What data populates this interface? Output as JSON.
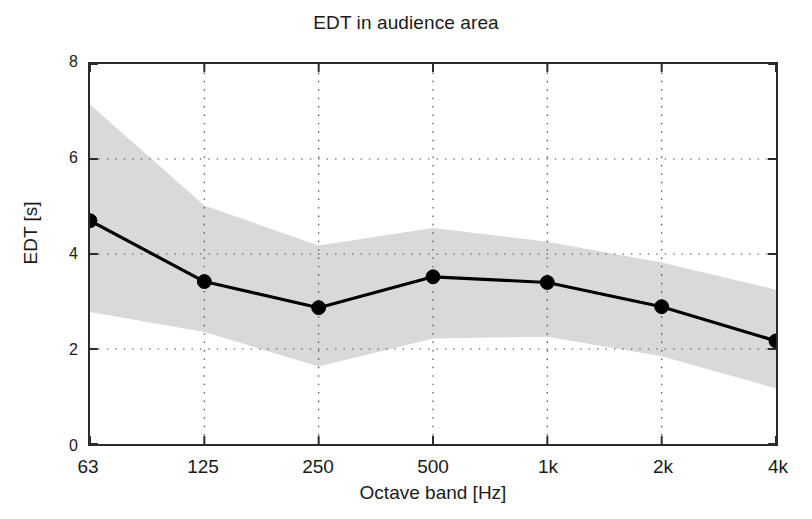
{
  "chart_data": {
    "type": "line",
    "title": "EDT in audience area",
    "xlabel": "Octave band [Hz]",
    "ylabel": "EDT [s]",
    "categories": [
      "63",
      "125",
      "250",
      "500",
      "1k",
      "2k",
      "4k"
    ],
    "values": [
      4.7,
      3.42,
      2.87,
      3.52,
      3.4,
      2.89,
      2.17
    ],
    "series": [
      {
        "name": "EDT mean",
        "values": [
          4.7,
          3.42,
          2.87,
          3.52,
          3.4,
          2.89,
          2.17
        ],
        "marker": "filled-circle",
        "color": "#000000"
      },
      {
        "name": "EDT spread band upper",
        "values": [
          7.15,
          5.02,
          4.18,
          4.55,
          4.26,
          3.82,
          3.25
        ],
        "color": "#d9d9d9"
      },
      {
        "name": "EDT spread band lower",
        "values": [
          2.78,
          2.36,
          1.63,
          2.22,
          2.26,
          1.85,
          1.17
        ],
        "color": "#d9d9d9"
      }
    ],
    "ylim": [
      0,
      8
    ],
    "yticks": [
      0,
      2,
      4,
      6,
      8
    ],
    "ytick_labels": [
      "0",
      "2",
      "4",
      "6",
      "8"
    ],
    "xtick_labels": [
      "63",
      "125",
      "250",
      "500",
      "1k",
      "2k",
      "4k"
    ],
    "grid": true,
    "grid_style": "dotted",
    "legend": "none",
    "band_color": "#d9d9d9",
    "line_color": "#000000",
    "axis_color": "#2b2b2b",
    "background": "#ffffff"
  }
}
